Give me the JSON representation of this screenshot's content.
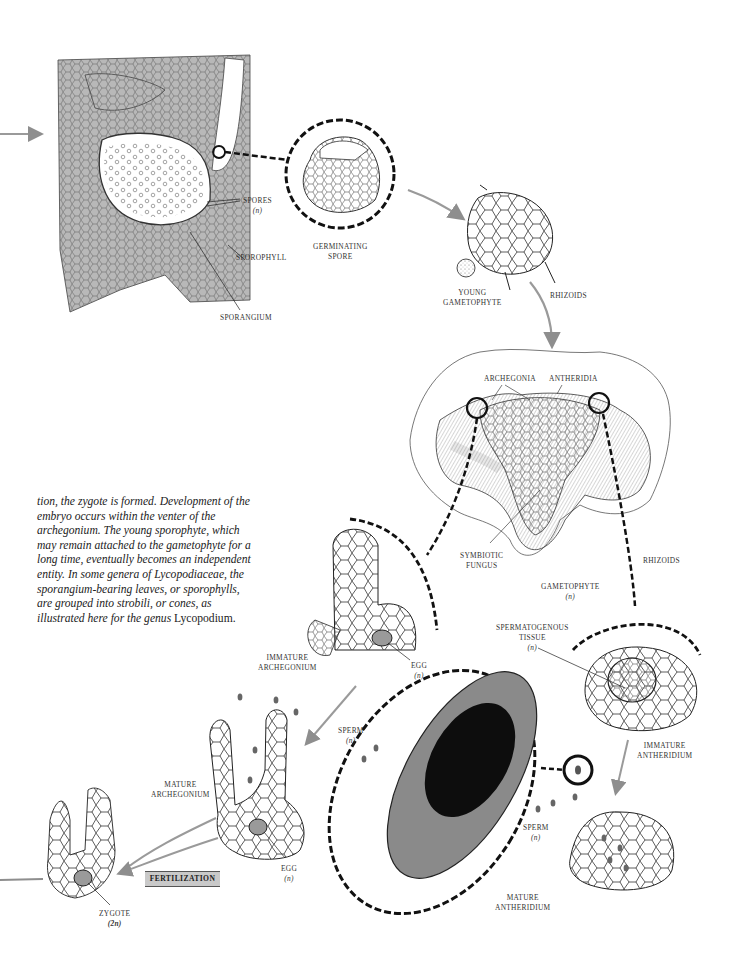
{
  "figure": {
    "accent_arrow_color": "#9a9a9a",
    "tissue_gray": "#b8b8b8"
  },
  "labels": {
    "spores": {
      "text": "SPORES",
      "sub": "(n)"
    },
    "sporophyll": {
      "text": "SPOROPHYLL"
    },
    "sporangium": {
      "text": "SPORANGIUM"
    },
    "germinating_spore": {
      "line1": "GERMINATING",
      "line2": "SPORE"
    },
    "young_gametophyte": {
      "line1": "YOUNG",
      "line2": "GAMETOPHYTE"
    },
    "rhizoids_top": {
      "text": "RHIZOIDS"
    },
    "archegonia": {
      "text": "ARCHEGONIA"
    },
    "antheridia": {
      "text": "ANTHERIDIA"
    },
    "symbiotic_fungus": {
      "line1": "SYMBIOTIC",
      "line2": "FUNGUS"
    },
    "rhizoids_mid": {
      "text": "RHIZOIDS"
    },
    "gametophyte": {
      "text": "GAMETOPHYTE",
      "sub": "(n)"
    },
    "immature_archegonium": {
      "line1": "IMMATURE",
      "line2": "ARCHEGONIUM"
    },
    "egg_top": {
      "text": "EGG",
      "sub": "(n)"
    },
    "spermatogenous_tissue": {
      "line1": "SPERMATOGENOUS",
      "line2": "TISSUE",
      "sub": "(n)"
    },
    "immature_antheridium": {
      "line1": "IMMATURE",
      "line2": "ANTHERIDIUM"
    },
    "sperm_left": {
      "text": "SPERM",
      "sub": "(n)"
    },
    "sperm_right": {
      "text": "SPERM",
      "sub": "(n)"
    },
    "mature_archegonium": {
      "line1": "MATURE",
      "line2": "ARCHEGONIUM"
    },
    "egg_bottom": {
      "text": "EGG",
      "sub": "(n)"
    },
    "mature_antheridium": {
      "line1": "MATURE",
      "line2": "ANTHERIDIUM"
    },
    "zygote": {
      "text": "ZYGOTE",
      "sub": "(2n)"
    },
    "fertilization": {
      "text": "FERTILIZATION"
    }
  },
  "body_text": {
    "italic_part": "tion, the zygote is formed. Development of the embryo occurs within the venter of the archegonium. The young sporophyte, which may remain attached to the gametophyte for a long time, eventually becomes an independent entity. In some genera of Lycopodiaceae, the sporangium-bearing leaves, or sporophylls, are grouped into strobili, or cones, as illustrated here for the genus",
    "upright_part": "Lycopodium."
  }
}
